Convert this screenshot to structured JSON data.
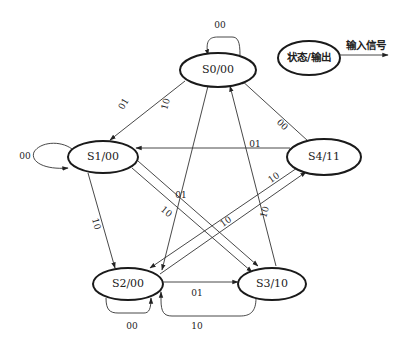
{
  "diagram": {
    "type": "state-machine",
    "legend": {
      "state_label": "状态/输出",
      "input_label": "输入信号"
    },
    "states": [
      {
        "id": "S0",
        "label": "S0/00",
        "output": "00"
      },
      {
        "id": "S1",
        "label": "S1/00",
        "output": "00"
      },
      {
        "id": "S2",
        "label": "S2/00",
        "output": "00"
      },
      {
        "id": "S3",
        "label": "S3/10",
        "output": "10"
      },
      {
        "id": "S4",
        "label": "S4/11",
        "output": "11"
      }
    ],
    "transitions": [
      {
        "from": "S0",
        "to": "S0",
        "input": "00"
      },
      {
        "from": "S0",
        "to": "S1",
        "input": "01"
      },
      {
        "from": "S0",
        "to": "S2",
        "input": "10"
      },
      {
        "from": "S1",
        "to": "S1",
        "input": "00"
      },
      {
        "from": "S1",
        "to": "S2",
        "input": "10"
      },
      {
        "from": "S1",
        "to": "S3",
        "input": "01"
      },
      {
        "from": "S4",
        "to": "S0",
        "input": "00"
      },
      {
        "from": "S4",
        "to": "S1",
        "input": "01"
      },
      {
        "from": "S4",
        "to": "S2",
        "input": "10"
      },
      {
        "from": "S2",
        "to": "S2",
        "input": "00"
      },
      {
        "from": "S2",
        "to": "S3",
        "input": "01"
      },
      {
        "from": "S2",
        "to": "S4",
        "input": "10"
      },
      {
        "from": "S3",
        "to": "S0",
        "input": "10"
      },
      {
        "from": "S3",
        "to": "S2",
        "input": "10"
      }
    ],
    "edge_labels": {
      "s0_self": "00",
      "s0_s1": "01",
      "s0_s2": "10",
      "s1_self": "00",
      "s1_s2": "10",
      "s1_s3": "01",
      "s4_s0": "00",
      "s4_s1": "01",
      "s4_s2": "10",
      "s2_self": "00",
      "s2_s3": "01",
      "s2_s4": "10",
      "s3_s0": "10",
      "s3_s2": "10"
    }
  }
}
